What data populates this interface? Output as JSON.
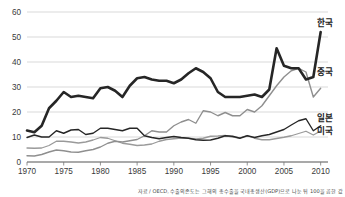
{
  "chart_data": {
    "type": "line",
    "title": "",
    "subtitle": "",
    "xlabel": "",
    "ylabel": "",
    "xlim": [
      1970,
      2011
    ],
    "ylim": [
      0,
      60
    ],
    "grid": true,
    "legend_position": "right-inline",
    "x_ticks": [
      "1970",
      "1975",
      "1980",
      "1985",
      "1990",
      "1995",
      "2000",
      "2005",
      "2010"
    ],
    "y_ticks": [
      "0",
      "10",
      "20",
      "30",
      "40",
      "50",
      "60"
    ],
    "x": [
      1970,
      1971,
      1972,
      1973,
      1974,
      1975,
      1976,
      1977,
      1978,
      1979,
      1980,
      1981,
      1982,
      1983,
      1984,
      1985,
      1986,
      1987,
      1988,
      1989,
      1990,
      1991,
      1992,
      1993,
      1994,
      1995,
      1996,
      1997,
      1998,
      1999,
      2000,
      2001,
      2002,
      2003,
      2004,
      2005,
      2006,
      2007,
      2008,
      2009,
      2010
    ],
    "series": [
      {
        "name": "한국",
        "color": "#262626",
        "width": 2.6,
        "label_x": 2009,
        "label_y": 55.5,
        "values": [
          12.6,
          11.9,
          14.5,
          21.5,
          24.5,
          28.0,
          26.0,
          26.5,
          26.0,
          25.5,
          29.5,
          30.0,
          28.5,
          26.0,
          30.5,
          33.5,
          34.0,
          33.0,
          32.5,
          32.5,
          31.5,
          33.0,
          35.5,
          37.5,
          36.0,
          33.5,
          28.0,
          26.0,
          26.0,
          26.0,
          26.5,
          27.0,
          26.0,
          29.0,
          45.5,
          38.5,
          37.5,
          37.5,
          33.0,
          34.0,
          52.0
        ],
        "values_note": "thick dark line, Korea export dependency; 1998 spike to ~46, 2008 peak ~52.3, 2010 ~51.5",
        "peaks": [
          {
            "year": 1998,
            "value": 45.8
          },
          {
            "year": 2008,
            "value": 52.3
          },
          {
            "year": 2010,
            "value": 51.5
          }
        ]
      },
      {
        "name": "중국",
        "color": "#8f8f8f",
        "width": 1.4,
        "label_x": 2009,
        "label_y": 36.0,
        "values": [
          2.5,
          2.4,
          3.0,
          4.0,
          4.8,
          4.5,
          4.0,
          3.9,
          4.5,
          5.0,
          6.0,
          7.5,
          8.3,
          8.0,
          8.5,
          9.0,
          10.5,
          12.5,
          12.0,
          12.0,
          14.5,
          16.0,
          17.0,
          15.5,
          20.5,
          20.0,
          18.5,
          19.8,
          18.5,
          18.5,
          21.0,
          20.0,
          22.5,
          26.5,
          30.5,
          34.0,
          36.5,
          37.5,
          36.0,
          26.0,
          29.5
        ],
        "values_note": "thin gray line, rises sharply after 2001, peak ~38 in 2006-07, drop to ~26 in 2009"
      },
      {
        "name": "일본",
        "color": "#262626",
        "width": 1.4,
        "label_x": 2009,
        "label_y": 17.5,
        "values": [
          9.8,
          10.8,
          10.0,
          10.0,
          12.5,
          11.5,
          12.8,
          13.0,
          11.0,
          11.5,
          13.5,
          13.5,
          13.0,
          12.5,
          13.5,
          13.5,
          10.5,
          9.8,
          9.3,
          9.8,
          10.2,
          9.8,
          9.5,
          8.9,
          8.7,
          8.8,
          9.5,
          10.5,
          10.3,
          9.5,
          10.5,
          9.8,
          10.5,
          11.0,
          12.0,
          13.0,
          14.8,
          16.5,
          17.3,
          12.5,
          14.5
        ],
        "values_note": "medium dark line, Japan; rises to ~17.3 in 2008, drops to ~12.5 in 2009"
      },
      {
        "name": "미국",
        "color": "#9a9a9a",
        "width": 1.3,
        "label_x": 2009,
        "label_y": 12.5,
        "values": [
          5.6,
          5.5,
          5.6,
          6.6,
          8.3,
          8.3,
          8.0,
          7.6,
          8.0,
          8.8,
          9.8,
          9.5,
          8.5,
          7.5,
          7.1,
          6.6,
          6.8,
          7.2,
          8.3,
          9.0,
          9.3,
          9.6,
          9.5,
          9.2,
          9.5,
          10.3,
          10.4,
          10.6,
          10.0,
          9.6,
          10.6,
          9.5,
          8.9,
          8.9,
          9.4,
          9.9,
          10.5,
          11.4,
          12.3,
          10.8,
          12.4
        ],
        "values_note": "thin gray line, USA; gradual rise, ~12.4 in 2010"
      }
    ]
  },
  "footnote": {
    "text": "자료 / OECD, 수출의존도는 그해의 총수출을 국내총생산(GDP)으로 나눈 뒤 100을 곱한 값"
  },
  "colors": {
    "korea_line": "#262626",
    "china_line": "#8f8f8f",
    "japan_line": "#262626",
    "usa_line": "#9a9a9a",
    "gridline": "#c9c9c9",
    "axis": "#555555",
    "text": "#3a3a3a",
    "background": "#ffffff"
  }
}
